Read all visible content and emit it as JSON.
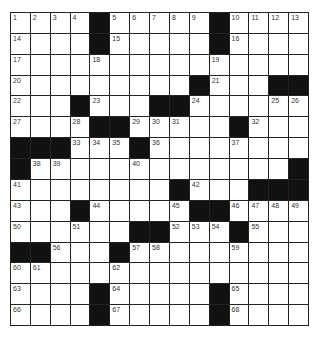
{
  "puzzle": {
    "rows": 15,
    "cols": 15,
    "colors": {
      "block": "#111111",
      "cell": "#ffffff",
      "line": "#222222",
      "number": "#333333"
    },
    "grid": [
      [
        "1",
        "2",
        "3",
        "4",
        "#",
        "5",
        "6",
        "7",
        "8",
        "9",
        "#",
        "10",
        "11",
        "12",
        "13"
      ],
      [
        "14",
        "",
        "",
        "",
        "#",
        "15",
        "",
        "",
        "",
        "",
        "#",
        "16",
        "",
        "",
        ""
      ],
      [
        "17",
        "",
        "",
        "",
        "18",
        "",
        "",
        "",
        "",
        "",
        "19",
        "",
        "",
        "",
        ""
      ],
      [
        "20",
        "",
        "",
        "",
        "",
        "",
        "",
        "",
        "",
        "#",
        "21",
        "",
        "",
        "#",
        "#"
      ],
      [
        "22",
        "",
        "",
        "#",
        "23",
        "",
        "",
        "#",
        "#",
        "24",
        "",
        "",
        "",
        "25",
        "26"
      ],
      [
        "27",
        "",
        "",
        "28",
        "#",
        "#",
        "29",
        "30",
        "31",
        "",
        "",
        "#",
        "32",
        "",
        ""
      ],
      [
        "#",
        "#",
        "#",
        "33",
        "34",
        "35",
        "#",
        "36",
        "",
        "",
        "",
        "37",
        "",
        "",
        ""
      ],
      [
        "#",
        "38",
        "39",
        "",
        "",
        "",
        "40",
        "",
        "",
        "",
        "",
        "",
        "",
        "",
        "#"
      ],
      [
        "41",
        "",
        "",
        "",
        "",
        "",
        "",
        "",
        "#",
        "42",
        "",
        "",
        "#",
        "#",
        "#"
      ],
      [
        "43",
        "",
        "",
        "#",
        "44",
        "",
        "",
        "",
        "45",
        "#",
        "#",
        "46",
        "47",
        "48",
        "49"
      ],
      [
        "50",
        "",
        "",
        "51",
        "",
        "",
        "#",
        "#",
        "52",
        "53",
        "54",
        "#",
        "55",
        "",
        ""
      ],
      [
        "#",
        "#",
        "56",
        "",
        "",
        "#",
        "57",
        "58",
        "",
        "",
        "",
        "59",
        "",
        "",
        ""
      ],
      [
        "60",
        "61",
        "",
        "",
        "",
        "62",
        "",
        "",
        "",
        "",
        "",
        "",
        "",
        "",
        ""
      ],
      [
        "63",
        "",
        "",
        "",
        "#",
        "64",
        "",
        "",
        "",
        "",
        "#",
        "65",
        "",
        "",
        ""
      ],
      [
        "66",
        "",
        "",
        "",
        "#",
        "67",
        "",
        "",
        "",
        "",
        "#",
        "68",
        "",
        "",
        ""
      ]
    ]
  }
}
